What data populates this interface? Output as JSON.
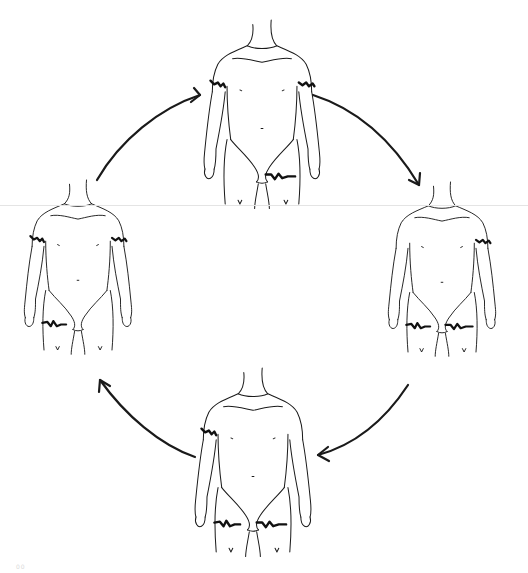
{
  "diagram": {
    "type": "cycle",
    "colors": {
      "background": "#ffffff",
      "line": "#1a1a1a",
      "band": "#111111"
    },
    "figures": [
      {
        "id": "top",
        "position": "top",
        "bands": [
          "right-upper-arm",
          "left-upper-arm",
          "left-thigh"
        ]
      },
      {
        "id": "right",
        "position": "right",
        "bands": [
          "left-upper-arm",
          "right-thigh",
          "left-thigh"
        ]
      },
      {
        "id": "bottom",
        "position": "bottom",
        "bands": [
          "right-upper-arm",
          "right-thigh",
          "left-thigh"
        ]
      },
      {
        "id": "left",
        "position": "left",
        "bands": [
          "right-upper-arm",
          "left-upper-arm",
          "right-thigh"
        ]
      }
    ],
    "arrows": [
      {
        "from": "left",
        "to": "top",
        "direction": "clockwise"
      },
      {
        "from": "top",
        "to": "right",
        "direction": "clockwise"
      },
      {
        "from": "right",
        "to": "bottom",
        "direction": "clockwise"
      },
      {
        "from": "bottom",
        "to": "left",
        "direction": "clockwise"
      }
    ],
    "corner_mark": "00"
  }
}
